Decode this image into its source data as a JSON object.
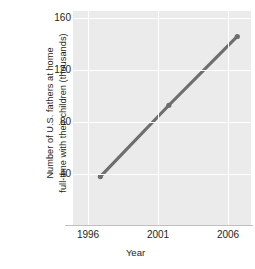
{
  "chart_data": {
    "type": "line",
    "title": "",
    "xlabel": "Year",
    "ylabel": "Number of U.S. fathers at home full-time with their children (thousands)",
    "ylabel_lines": [
      "Number of U.S. fathers at home",
      "full-time with their children (thousands)"
    ],
    "x": [
      1996,
      2001,
      2006
    ],
    "values": [
      42,
      98,
      152
    ],
    "categories": [
      "1996",
      "2001",
      "2006"
    ],
    "xticklabels": [
      "1996",
      "2001",
      "2006"
    ],
    "yticklabels": [
      "160",
      "120",
      "80",
      "40"
    ],
    "yticks": [
      160,
      120,
      80,
      40
    ],
    "xlim": [
      1994.0,
      2007.0
    ],
    "ylim": [
      4,
      172
    ],
    "grid": "white gridlines on gray panel, horizontal at y ticks and vertical at x ticks",
    "legend": "none",
    "series": [
      {
        "name": "U.S. stay-at-home fathers",
        "values": [
          42,
          98,
          152
        ],
        "color": "#6e6e6e",
        "marker": "round",
        "linewidth": 3.2
      }
    ],
    "colors": {
      "line": "#6e6e6e",
      "panel_background": "#ebebeb",
      "gridline": "#ffffff",
      "axis_line": "#bfbfbf",
      "text": "#231f20",
      "page_background": "#ffffff"
    }
  }
}
